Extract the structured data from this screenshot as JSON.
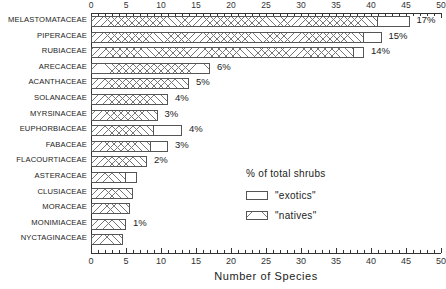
{
  "chart_data": {
    "type": "bar",
    "orientation": "horizontal",
    "title": "",
    "xlabel": "Number of Species",
    "ylabel": "",
    "xlim": [
      0,
      50
    ],
    "xticks": [
      0,
      5,
      10,
      15,
      20,
      25,
      30,
      35,
      40,
      45,
      50
    ],
    "xtick_labels": [
      "0",
      "5",
      "10",
      "15",
      "20",
      "25",
      "30",
      "35",
      "40",
      "45",
      "50"
    ],
    "minor_tick_step": 1,
    "grid": false,
    "top_axis_mirrored": true,
    "legend": {
      "title": "% of total shrubs",
      "position": "inside-lower-right",
      "entries": [
        {
          "label": "\"exotics\"",
          "pattern": "solid-white"
        },
        {
          "label": "\"natives\"",
          "pattern": "cross-hatch"
        }
      ]
    },
    "categories": [
      "MELASTOMATACEAE",
      "PIPERACEAE",
      "RUBIACEAE",
      "ARECACEAE",
      "ACANTHACEAE",
      "SOLANACEAE",
      "MYRSINACEAE",
      "EUPHORBIACEAE",
      "FABACEAE",
      "FLACOURTIACEAE",
      "ASTERACEAE",
      "CLUSIACEAE",
      "MORACEAE",
      "MONIMIACEAE",
      "NYCTAGINACEAE"
    ],
    "series": [
      {
        "name": "\"natives\"",
        "values": [
          41,
          39,
          37.5,
          17,
          14,
          11,
          9.5,
          9,
          8.5,
          8,
          5,
          6,
          5.5,
          5,
          4.5
        ]
      },
      {
        "name": "\"exotics\"",
        "values": [
          4.5,
          2.5,
          1.5,
          0,
          0,
          0,
          0,
          4,
          2.5,
          0,
          1.5,
          0,
          0,
          0,
          0
        ]
      }
    ],
    "totals": [
      45.5,
      41.5,
      39,
      17,
      14,
      11,
      9.5,
      13,
      11,
      8,
      6.5,
      6,
      5.5,
      5,
      4.5
    ],
    "percent_labels": [
      "17%",
      "15%",
      "14%",
      "6%",
      "5%",
      "4%",
      "3%",
      "4%",
      "3%",
      "2%",
      "",
      "",
      "",
      "1%",
      ""
    ]
  },
  "colors": {
    "axis": "#333333",
    "bar_border": "#555555",
    "hatch": "#777777",
    "background": "#ffffff",
    "text": "#222222"
  }
}
